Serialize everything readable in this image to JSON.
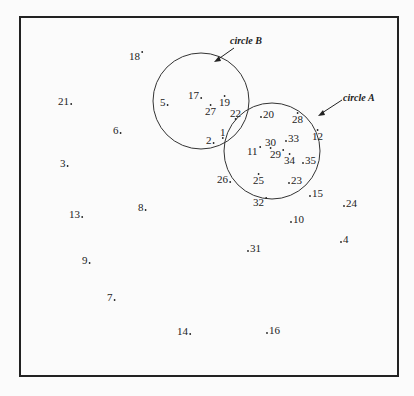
{
  "diagram": {
    "circles": [
      {
        "id": "B",
        "label": "circle B",
        "members": [
          "19",
          "17",
          "5",
          "27",
          "22",
          "1",
          "2"
        ]
      },
      {
        "id": "A",
        "label": "circle A",
        "members": [
          "20",
          "28",
          "12",
          "30",
          "33",
          "11",
          "29",
          "34",
          "35",
          "25",
          "23"
        ]
      }
    ],
    "points": [
      {
        "label": "18",
        "dot": "after-up"
      },
      {
        "label": "21",
        "dot": "after"
      },
      {
        "label": "6",
        "dot": "after"
      },
      {
        "label": "3",
        "dot": "after"
      },
      {
        "label": "13",
        "dot": "after"
      },
      {
        "label": "8",
        "dot": "after"
      },
      {
        "label": "9",
        "dot": "after"
      },
      {
        "label": "7",
        "dot": "after"
      },
      {
        "label": "14",
        "dot": "after"
      },
      {
        "label": "5",
        "dot": "after"
      },
      {
        "label": "17",
        "dot": "after"
      },
      {
        "label": "19",
        "dot": "above"
      },
      {
        "label": "27",
        "dot": "above"
      },
      {
        "label": "22",
        "dot": "below"
      },
      {
        "label": "1",
        "dot": "below"
      },
      {
        "label": "2",
        "dot": "after"
      },
      {
        "label": "20",
        "dot": "before"
      },
      {
        "label": "28",
        "dot": "above"
      },
      {
        "label": "12",
        "dot": "above"
      },
      {
        "label": "30",
        "dot": "below"
      },
      {
        "label": "33",
        "dot": "before"
      },
      {
        "label": "11",
        "dot": "after-up"
      },
      {
        "label": "29",
        "dot": "after-up"
      },
      {
        "label": "34",
        "dot": "above"
      },
      {
        "label": "35",
        "dot": "before"
      },
      {
        "label": "26",
        "dot": "after"
      },
      {
        "label": "25",
        "dot": "above"
      },
      {
        "label": "23",
        "dot": "before"
      },
      {
        "label": "15",
        "dot": "before"
      },
      {
        "label": "32",
        "dot": "after-up"
      },
      {
        "label": "24",
        "dot": "before"
      },
      {
        "label": "10",
        "dot": "before"
      },
      {
        "label": "4",
        "dot": "before"
      },
      {
        "label": "31",
        "dot": "before"
      },
      {
        "label": "16",
        "dot": "before"
      }
    ]
  }
}
